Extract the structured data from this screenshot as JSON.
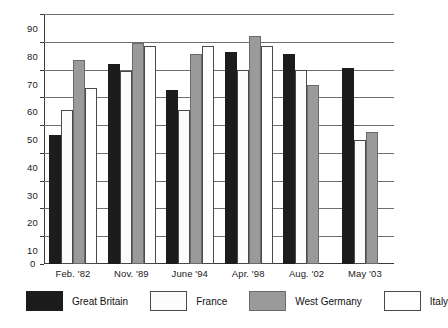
{
  "chart_data": {
    "type": "bar",
    "title": "",
    "subtitle": "",
    "xlabel": "",
    "ylabel": "",
    "ylim": [
      0,
      90
    ],
    "ytick_step": 10,
    "yticks": [
      0,
      10,
      20,
      30,
      40,
      50,
      60,
      70,
      80,
      90
    ],
    "ytick_labels": [
      "0",
      "10",
      "20",
      "30",
      "40",
      "50",
      "60",
      "70",
      "80",
      "90"
    ],
    "grid": true,
    "grid_axis": "y",
    "legend_position": "bottom",
    "categories": [
      "Feb. '82",
      "Nov. '89",
      "June '94",
      "Apr. '98",
      "Aug. '02",
      "May '03"
    ],
    "series": [
      {
        "name": "Great Britain",
        "color": "#1c1c1c",
        "pattern": "solid-black",
        "values": [
          46.5,
          72,
          62.5,
          76.5,
          75.5,
          70.5
        ]
      },
      {
        "name": "France",
        "color": "#fcfcfc",
        "pattern": "speckled",
        "values": [
          55.5,
          69.5,
          55.5,
          70,
          70,
          44.5
        ]
      },
      {
        "name": "West Germany",
        "color": "#9a9a9a",
        "pattern": "solid-gray",
        "values": [
          73.5,
          79.5,
          75.5,
          82,
          64.5,
          47.5
        ]
      },
      {
        "name": "Italy",
        "color": "#ffffff",
        "pattern": "outline-white",
        "values": [
          63.5,
          78.5,
          78.5,
          78.5,
          0,
          0
        ]
      }
    ]
  },
  "legend": {
    "entries": [
      {
        "label": "Great Britain",
        "key": "gb"
      },
      {
        "label": "France",
        "key": "fr"
      },
      {
        "label": "West Germany",
        "key": "wg"
      },
      {
        "label": "Italy",
        "key": "it"
      }
    ]
  },
  "axis": {
    "zero_label": "0"
  }
}
